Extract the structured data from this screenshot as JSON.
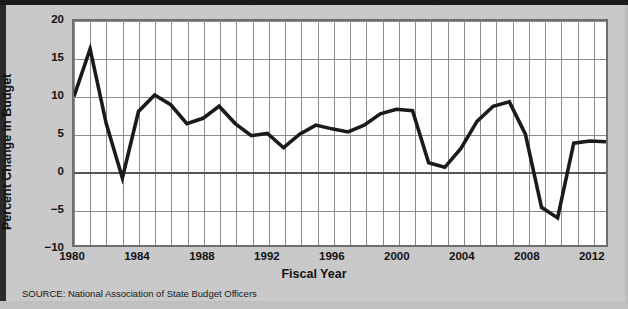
{
  "figure": {
    "title": "Annual Change in State General Fund Budgets",
    "source_note": "SOURCE: National Association of State Budget Officers",
    "background_color": "#c9c9c9",
    "plot_background_color": "#ffffff",
    "line_color": "#1a1a1a",
    "grid_color": "#8c8c8c",
    "frame_color": "#6e6e6e"
  },
  "chart_data": {
    "type": "line",
    "title": "Annual Change in State General Fund Budgets",
    "xlabel": "Fiscal Year",
    "ylabel": "Percent Change in Budget",
    "xlim": [
      1980,
      2013
    ],
    "ylim": [
      -10,
      20
    ],
    "ytick_labels": [
      "20",
      "15",
      "10",
      "5",
      "0",
      "-5",
      "-10"
    ],
    "yticks": [
      20,
      15,
      10,
      5,
      0,
      -5,
      -10
    ],
    "xtick_labels": [
      "1980",
      "1984",
      "1988",
      "1992",
      "1996",
      "2000",
      "2004",
      "2008",
      "2012"
    ],
    "xticks": [
      1980,
      1984,
      1988,
      1992,
      1996,
      2000,
      2004,
      2008,
      2012
    ],
    "grid": true,
    "grid_spacing_x": 1,
    "grid_spacing_y": 5,
    "legend": false,
    "zero_line": 0,
    "x": [
      1980,
      1981,
      1982,
      1983,
      1984,
      1985,
      1986,
      1987,
      1988,
      1989,
      1990,
      1991,
      1992,
      1993,
      1994,
      1995,
      1996,
      1997,
      1998,
      1999,
      2000,
      2001,
      2002,
      2003,
      2004,
      2005,
      2006,
      2007,
      2008,
      2009,
      2010,
      2011,
      2012,
      2013
    ],
    "values": [
      10.0,
      16.3,
      6.4,
      -0.8,
      8.0,
      10.2,
      8.9,
      6.4,
      7.1,
      8.7,
      6.4,
      4.8,
      5.1,
      3.2,
      5.0,
      6.2,
      5.7,
      5.3,
      6.2,
      7.7,
      8.3,
      8.1,
      1.2,
      0.6,
      3.1,
      6.7,
      8.7,
      9.3,
      5.0,
      -4.7,
      -6.1,
      3.8,
      4.1,
      4.0
    ],
    "series": [
      {
        "name": "Percent Change in Budget",
        "values": [
          10.0,
          16.3,
          6.4,
          -0.8,
          8.0,
          10.2,
          8.9,
          6.4,
          7.1,
          8.7,
          6.4,
          4.8,
          5.1,
          3.2,
          5.0,
          6.2,
          5.7,
          5.3,
          6.2,
          7.7,
          8.3,
          8.1,
          1.2,
          0.6,
          3.1,
          6.7,
          8.7,
          9.3,
          5.0,
          -4.7,
          -6.1,
          3.8,
          4.1,
          4.0
        ]
      }
    ]
  }
}
